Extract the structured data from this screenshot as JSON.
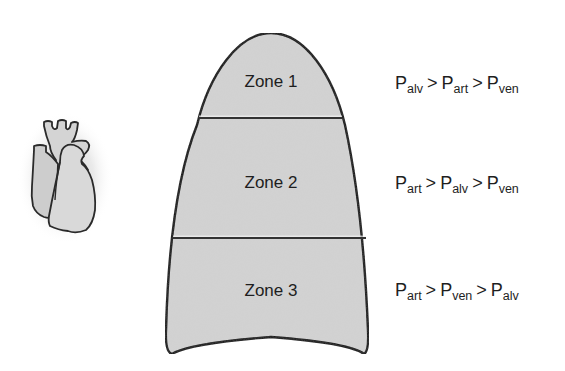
{
  "diagram": {
    "title": "",
    "colors": {
      "lung_fill": "#d3d3d3",
      "outline": "#111111",
      "heart_fill": "#cfcfcf",
      "background": "#ffffff"
    },
    "heart": {
      "icon": "heart-icon"
    },
    "lung": {
      "zones": [
        {
          "label": "Zone 1",
          "relation": [
            {
              "p": "P",
              "sub": "alv"
            },
            {
              "op": ">"
            },
            {
              "p": "P",
              "sub": "art"
            },
            {
              "op": ">"
            },
            {
              "p": "P",
              "sub": "ven"
            }
          ]
        },
        {
          "label": "Zone 2",
          "relation": [
            {
              "p": "P",
              "sub": "art"
            },
            {
              "op": ">"
            },
            {
              "p": "P",
              "sub": "alv"
            },
            {
              "op": ">"
            },
            {
              "p": "P",
              "sub": "ven"
            }
          ]
        },
        {
          "label": "Zone 3",
          "relation": [
            {
              "p": "P",
              "sub": "art"
            },
            {
              "op": ">"
            },
            {
              "p": "P",
              "sub": "ven"
            },
            {
              "op": ">"
            },
            {
              "p": "P",
              "sub": "alv"
            }
          ]
        }
      ]
    },
    "equations": {
      "zone1": {
        "t1": "P",
        "s1": "alv",
        "o1": ">",
        "t2": "P",
        "s2": "art",
        "o2": ">",
        "t3": "P",
        "s3": "ven"
      },
      "zone2": {
        "t1": "P",
        "s1": "art",
        "o1": ">",
        "t2": "P",
        "s2": "alv",
        "o2": ">",
        "t3": "P",
        "s3": "ven"
      },
      "zone3": {
        "t1": "P",
        "s1": "art",
        "o1": ">",
        "t2": "P",
        "s2": "ven",
        "o2": ">",
        "t3": "P",
        "s3": "alv"
      }
    }
  }
}
